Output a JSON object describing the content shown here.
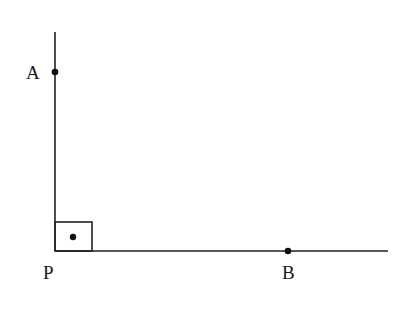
{
  "diagram": {
    "type": "geometry-right-angle",
    "points": [
      {
        "name": "A",
        "label": "A"
      },
      {
        "name": "P",
        "label": "P"
      },
      {
        "name": "B",
        "label": "B"
      }
    ],
    "right_angle_marker": "square-with-dot",
    "stroke_color": "#222222"
  }
}
